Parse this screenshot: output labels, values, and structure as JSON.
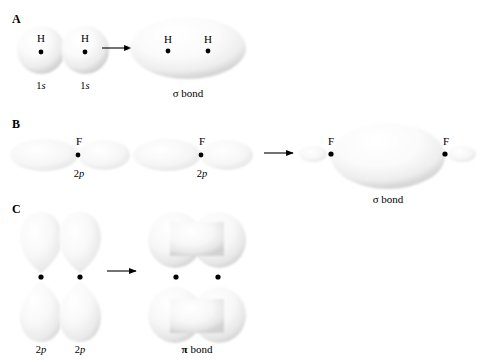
{
  "figure": {
    "background_color": "#ffffff",
    "orbital_fill_light": "#ffffff",
    "orbital_fill_shadow": "#d8d8d8",
    "nucleus_color": "#000000",
    "arrow_color": "#000000"
  },
  "panels": [
    {
      "letter": "A",
      "description": "Two hydrogen 1s orbitals overlap to form a sigma bond",
      "reactants": [
        {
          "atom": "H",
          "orbital_prefix": "1",
          "orbital_letter": "s",
          "shape": "sphere"
        },
        {
          "atom": "H",
          "orbital_prefix": "1",
          "orbital_letter": "s",
          "shape": "sphere"
        }
      ],
      "arrow": "right-arrow",
      "product": {
        "atoms": [
          "H",
          "H"
        ],
        "bond_symbol": "σ",
        "bond_label": "bond",
        "shape": "ellipse"
      }
    },
    {
      "letter": "B",
      "description": "Two fluorine 2p orbitals overlap end-on to form a sigma bond",
      "reactants": [
        {
          "atom": "F",
          "orbital_prefix": "2",
          "orbital_letter": "p",
          "shape": "dumbbell-horizontal"
        },
        {
          "atom": "F",
          "orbital_prefix": "2",
          "orbital_letter": "p",
          "shape": "dumbbell-horizontal"
        }
      ],
      "arrow": "right-arrow",
      "product": {
        "atoms": [
          "F",
          "F"
        ],
        "bond_symbol": "σ",
        "bond_label": "bond",
        "shape": "large-ellipse-with-end-lobes"
      }
    },
    {
      "letter": "C",
      "description": "Two 2p orbitals overlap side-on to form a pi bond",
      "reactants": [
        {
          "atom": "",
          "orbital_prefix": "2",
          "orbital_letter": "p",
          "shape": "dumbbell-vertical"
        },
        {
          "atom": "",
          "orbital_prefix": "2",
          "orbital_letter": "p",
          "shape": "dumbbell-vertical"
        }
      ],
      "arrow": "right-arrow",
      "product": {
        "atoms": [],
        "bond_symbol": "π",
        "bond_label": "bond",
        "shape": "two-peanut-lobes"
      }
    }
  ]
}
